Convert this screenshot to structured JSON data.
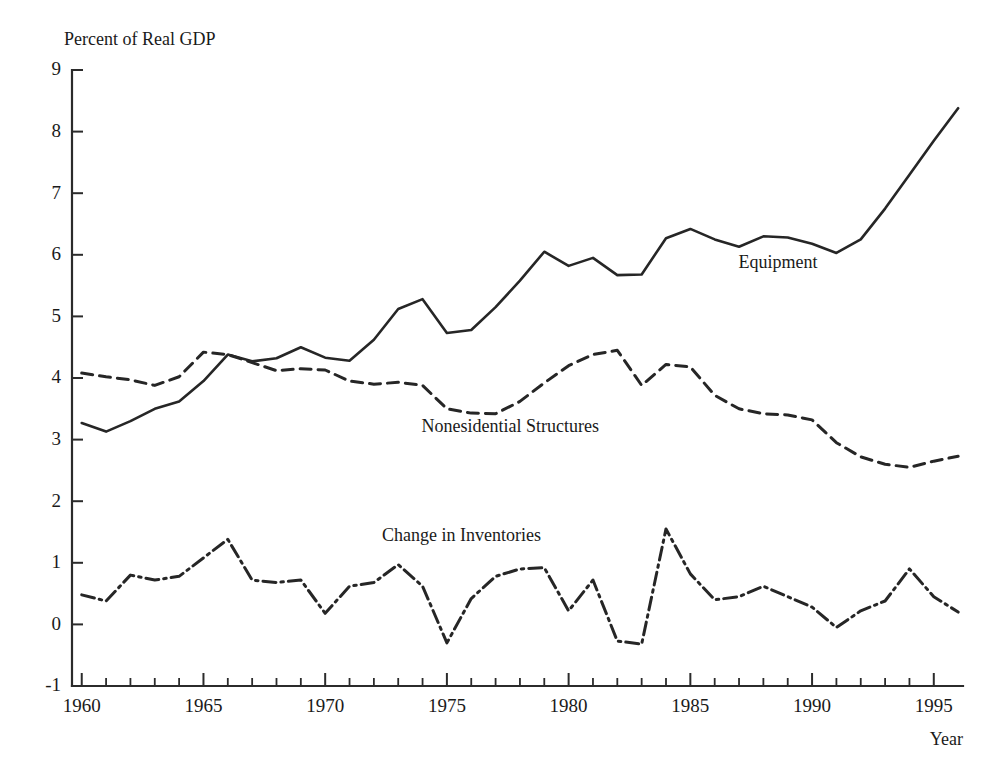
{
  "chart_data": {
    "type": "line",
    "title": "",
    "ylabel": "Percent of Real GDP",
    "xlabel": "Year",
    "xlim": [
      1959.6,
      1996.2
    ],
    "ylim": [
      -1,
      9
    ],
    "grid": false,
    "legend_position": "inline-annotations",
    "xticks_major": [
      1960,
      1965,
      1970,
      1975,
      1980,
      1985,
      1990,
      1995
    ],
    "xtick_labels": [
      "1960",
      "1965",
      "1970",
      "1975",
      "1980",
      "1985",
      "1990",
      "1995"
    ],
    "xticks_minor_step": 1,
    "yticks": [
      -1,
      0,
      1,
      2,
      3,
      4,
      5,
      6,
      7,
      8,
      9
    ],
    "ytick_labels": [
      "-1",
      "0",
      "1",
      "2",
      "3",
      "4",
      "5",
      "6",
      "7",
      "8",
      "9"
    ],
    "x": [
      1960,
      1961,
      1962,
      1963,
      1964,
      1965,
      1966,
      1967,
      1968,
      1969,
      1970,
      1971,
      1972,
      1973,
      1974,
      1975,
      1976,
      1977,
      1978,
      1979,
      1980,
      1981,
      1982,
      1983,
      1984,
      1985,
      1986,
      1987,
      1988,
      1989,
      1990,
      1991,
      1992,
      1993,
      1994,
      1995,
      1996
    ],
    "series": [
      {
        "name": "Equipment",
        "style": "solid",
        "label_x": 1988.6,
        "label_y": 5.78,
        "values": [
          3.27,
          3.13,
          3.3,
          3.5,
          3.62,
          3.95,
          4.38,
          4.27,
          4.32,
          4.5,
          4.33,
          4.28,
          4.62,
          5.12,
          5.28,
          4.73,
          4.78,
          5.15,
          5.58,
          6.05,
          5.82,
          5.95,
          5.67,
          5.68,
          6.27,
          6.42,
          6.25,
          6.13,
          6.3,
          6.28,
          6.18,
          6.03,
          6.25,
          6.75,
          7.3,
          7.85,
          8.38
        ]
      },
      {
        "name": "Nonesidential Structures",
        "style": "dashed",
        "label_x": 1977.6,
        "label_y": 3.13,
        "values": [
          4.08,
          4.02,
          3.97,
          3.88,
          4.02,
          4.42,
          4.38,
          4.25,
          4.12,
          4.15,
          4.13,
          3.95,
          3.9,
          3.93,
          3.88,
          3.5,
          3.43,
          3.42,
          3.62,
          3.92,
          4.2,
          4.38,
          4.45,
          3.88,
          4.22,
          4.18,
          3.72,
          3.5,
          3.42,
          3.4,
          3.32,
          2.95,
          2.72,
          2.6,
          2.55,
          2.65,
          2.73
        ]
      },
      {
        "name": "Change in Inventories",
        "style": "dash-dot",
        "label_x": 1975.6,
        "label_y": 1.35,
        "values": [
          0.48,
          0.38,
          0.8,
          0.72,
          0.78,
          1.08,
          1.38,
          0.72,
          0.68,
          0.72,
          0.18,
          0.62,
          0.68,
          0.97,
          0.62,
          -0.3,
          0.42,
          0.78,
          0.9,
          0.92,
          0.22,
          0.72,
          -0.27,
          -0.32,
          1.55,
          0.82,
          0.4,
          0.45,
          0.62,
          0.45,
          0.28,
          -0.05,
          0.22,
          0.38,
          0.9,
          0.45,
          0.2
        ]
      }
    ]
  }
}
